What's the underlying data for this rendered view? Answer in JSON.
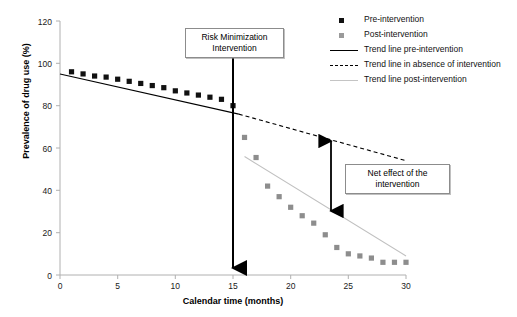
{
  "chart_data": {
    "type": "scatter",
    "title": "",
    "xlabel": "Calendar time (months)",
    "ylabel": "Prevalence of drug use (%)",
    "xlim": [
      0,
      30
    ],
    "ylim": [
      0,
      120
    ],
    "xticks": [
      0,
      5,
      10,
      15,
      20,
      25,
      30
    ],
    "yticks": [
      0,
      20,
      40,
      60,
      80,
      100,
      120
    ],
    "grid": false,
    "legend_position": "top-right",
    "series": [
      {
        "name": "Pre-intervention",
        "type": "scatter",
        "marker": "square",
        "color": "#111111",
        "x": [
          1,
          2,
          3,
          4,
          5,
          6,
          7,
          8,
          9,
          10,
          11,
          12,
          13,
          14,
          15
        ],
        "values": [
          96,
          95,
          94,
          93.5,
          92.5,
          91.5,
          90.5,
          89.5,
          88.5,
          87,
          86,
          85,
          84,
          83,
          80
        ]
      },
      {
        "name": "Post-intervention",
        "type": "scatter",
        "marker": "square",
        "color": "#8d8d8d",
        "x": [
          16,
          17,
          18,
          19,
          20,
          21,
          22,
          23,
          24,
          25,
          26,
          27,
          28,
          29,
          30
        ],
        "values": [
          65,
          55.5,
          42,
          37,
          32,
          28,
          24.5,
          19,
          13,
          10,
          9,
          8,
          6,
          6,
          6
        ]
      },
      {
        "name": "Trend line pre-intervention",
        "type": "line",
        "style": "solid",
        "color": "#000000",
        "x": [
          0,
          15.5
        ],
        "values": [
          95,
          76
        ]
      },
      {
        "name": "Trend line in absence of intervention",
        "type": "line",
        "style": "dashed",
        "color": "#000000",
        "x": [
          15.5,
          30
        ],
        "values": [
          76,
          54
        ]
      },
      {
        "name": "Trend line post-intervention",
        "type": "line",
        "style": "solid-light",
        "color": "#c0c0c0",
        "x": [
          16,
          30
        ],
        "values": [
          56,
          9
        ]
      }
    ],
    "annotations": [
      {
        "name": "intervention-marker",
        "label": "Risk Minimization Intervention",
        "x": 15.5,
        "type": "vertical-arrow"
      },
      {
        "name": "net-effect",
        "label": "Net effect of the intervention",
        "x": 23,
        "y_top": 65,
        "y_bottom": 30,
        "type": "double-arrow"
      }
    ]
  },
  "axes": {
    "y_title": "Prevalence of drug use (%)",
    "x_title": "Calendar time (months)",
    "y_tick_labels": [
      "0",
      "20",
      "40",
      "60",
      "80",
      "100",
      "120"
    ],
    "x_tick_labels": [
      "0",
      "5",
      "10",
      "15",
      "20",
      "25",
      "30"
    ]
  },
  "legend": {
    "items": [
      {
        "label": "Pre-intervention",
        "key": "square-black"
      },
      {
        "label": "Post-intervention",
        "key": "square-gray"
      },
      {
        "label": "Trend line pre-intervention",
        "key": "line-solid"
      },
      {
        "label": "Trend line in absence of intervention",
        "key": "line-dashed"
      },
      {
        "label": "Trend line post-intervention",
        "key": "line-light"
      }
    ]
  },
  "callouts": {
    "intervention": {
      "line1": "Risk Minimization",
      "line2": "Intervention"
    },
    "net_effect": {
      "line1": "Net effect of the",
      "line2": "intervention"
    }
  },
  "colors": {
    "pre_marker": "#111111",
    "post_marker": "#8d8d8d",
    "trend_pre": "#000000",
    "trend_absence": "#000000",
    "trend_post": "#c0c0c0",
    "axis": "#b0b0b0"
  }
}
